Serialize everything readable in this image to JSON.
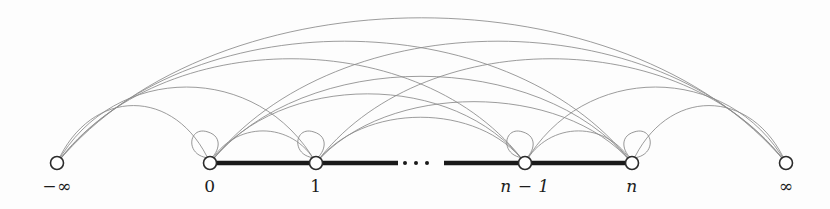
{
  "figure": {
    "background_color": "#fdfdfd",
    "arc_color": "#8a8a8a",
    "baseline_color": "#1a1a1a",
    "node_stroke_color": "#2b2b2b",
    "node_fill_color": "#ffffff",
    "width": 830,
    "height": 209
  },
  "nodes": [
    {
      "id": "minus-infinity",
      "label": "−∞",
      "label_style": "upright",
      "x": 57,
      "y": 163,
      "label_x": 57,
      "label_y": 176,
      "radius": 6.5,
      "self_loop": false
    },
    {
      "id": "zero",
      "label": "0",
      "label_style": "upright",
      "x": 210,
      "y": 163,
      "label_x": 210,
      "label_y": 176,
      "radius": 6.5,
      "self_loop": true
    },
    {
      "id": "one",
      "label": "1",
      "label_style": "upright",
      "x": 316,
      "y": 163,
      "label_x": 316,
      "label_y": 176,
      "radius": 6.5,
      "self_loop": true
    },
    {
      "id": "n-minus-one",
      "label": "n − 1",
      "label_style": "italic",
      "x": 525,
      "y": 163,
      "label_x": 525,
      "label_y": 176,
      "radius": 6.5,
      "self_loop": true
    },
    {
      "id": "n",
      "label": "n",
      "label_style": "italic",
      "x": 632,
      "y": 163,
      "label_x": 632,
      "label_y": 176,
      "radius": 6.5,
      "self_loop": true
    },
    {
      "id": "plus-infinity",
      "label": "∞",
      "label_style": "upright",
      "x": 786,
      "y": 163,
      "label_x": 786,
      "label_y": 176,
      "radius": 6.5,
      "self_loop": false
    }
  ],
  "baseline_segments": [
    {
      "id": "segment-0-1",
      "x1": 210,
      "x2": 316,
      "y": 163
    },
    {
      "id": "segment-1-ellipsis",
      "x1": 316,
      "x2": 398,
      "y": 163
    },
    {
      "id": "segment-ellipsis-nminus1",
      "x1": 444,
      "x2": 525,
      "y": 163
    },
    {
      "id": "segment-nminus1-n",
      "x1": 525,
      "x2": 632,
      "y": 163
    }
  ],
  "ellipsis": {
    "label": "· · ·",
    "dots": [
      {
        "x": 405,
        "y": 163
      },
      {
        "x": 416,
        "y": 163
      },
      {
        "x": 427,
        "y": 163
      }
    ],
    "radius": 2
  },
  "self_loops": [
    {
      "node": "zero",
      "direction": "up-left",
      "cx": 210,
      "cy": 163
    },
    {
      "node": "one",
      "direction": "up-left",
      "cx": 316,
      "cy": 163
    },
    {
      "node": "n-minus-one",
      "direction": "up-left",
      "cx": 525,
      "cy": 163
    },
    {
      "node": "n",
      "direction": "up-right",
      "cx": 632,
      "cy": 163
    }
  ],
  "arcs": [
    {
      "id": "arc-minf-inf",
      "from": "minus-infinity",
      "to": "plus-infinity",
      "x1": 57,
      "x2": 786,
      "peak_y": 14
    },
    {
      "id": "arc-minf-n",
      "from": "minus-infinity",
      "to": "n",
      "x1": 57,
      "x2": 632,
      "peak_y": 38
    },
    {
      "id": "arc-minf-nminus1",
      "from": "minus-infinity",
      "to": "n-minus-one",
      "x1": 57,
      "x2": 525,
      "peak_y": 56
    },
    {
      "id": "arc-minf-one",
      "from": "minus-infinity",
      "to": "one",
      "x1": 57,
      "x2": 316,
      "peak_y": 85
    },
    {
      "id": "arc-minf-zero",
      "from": "minus-infinity",
      "to": "zero",
      "x1": 57,
      "x2": 210,
      "peak_y": 104
    },
    {
      "id": "arc-zero-inf",
      "from": "zero",
      "to": "plus-infinity",
      "x1": 210,
      "x2": 786,
      "peak_y": 38
    },
    {
      "id": "arc-one-inf",
      "from": "one",
      "to": "plus-infinity",
      "x1": 316,
      "x2": 786,
      "peak_y": 56
    },
    {
      "id": "arc-nminus1-inf",
      "from": "n-minus-one",
      "to": "plus-infinity",
      "x1": 525,
      "x2": 786,
      "peak_y": 85
    },
    {
      "id": "arc-n-inf",
      "from": "n",
      "to": "plus-infinity",
      "x1": 632,
      "x2": 786,
      "peak_y": 104
    },
    {
      "id": "arc-zero-n",
      "from": "zero",
      "to": "n",
      "x1": 210,
      "x2": 632,
      "peak_y": 74
    },
    {
      "id": "arc-zero-nminus1",
      "from": "zero",
      "to": "n-minus-one",
      "x1": 210,
      "x2": 525,
      "peak_y": 92
    },
    {
      "id": "arc-one-n",
      "from": "one",
      "to": "n",
      "x1": 316,
      "x2": 632,
      "peak_y": 100
    },
    {
      "id": "arc-one-nminus1",
      "from": "one",
      "to": "n-minus-one",
      "x1": 316,
      "x2": 525,
      "peak_y": 116
    },
    {
      "id": "arc-zero-one",
      "from": "zero",
      "to": "one",
      "x1": 210,
      "x2": 316,
      "peak_y": 130
    },
    {
      "id": "arc-nminus1-n",
      "from": "n-minus-one",
      "to": "n",
      "x1": 525,
      "x2": 632,
      "peak_y": 130
    }
  ]
}
